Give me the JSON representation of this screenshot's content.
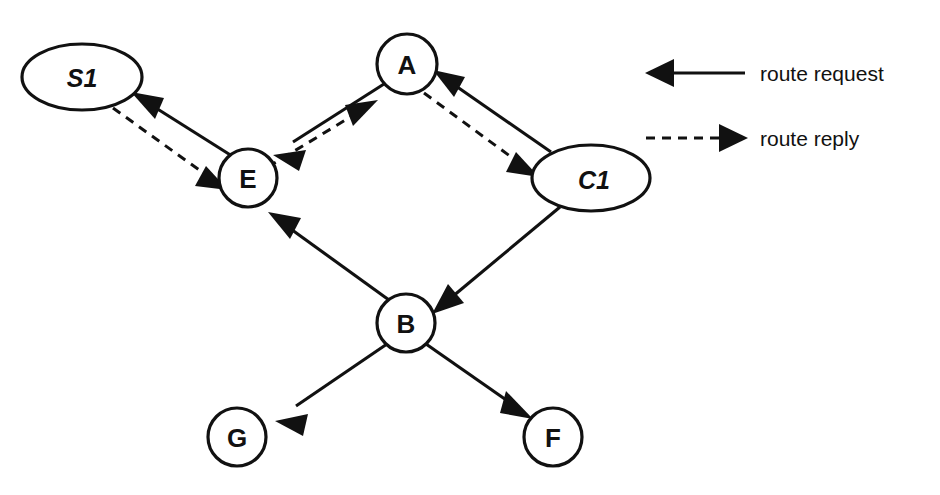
{
  "diagram": {
    "type": "network-routing-diagram",
    "background": "#ffffff",
    "ink_color": "#111111",
    "nodes": [
      {
        "id": "S1",
        "label": "S1",
        "shape": "ellipse",
        "style": "italic-bold",
        "cx": 82,
        "cy": 77,
        "rx": 60,
        "ry": 33
      },
      {
        "id": "A",
        "label": "A",
        "shape": "circle",
        "style": "bold",
        "cx": 407,
        "cy": 64,
        "rx": 30,
        "ry": 30
      },
      {
        "id": "E",
        "label": "E",
        "shape": "circle",
        "style": "bold",
        "cx": 248,
        "cy": 178,
        "rx": 29,
        "ry": 29
      },
      {
        "id": "C1",
        "label": "C1",
        "shape": "ellipse",
        "style": "italic-bold",
        "cx": 591,
        "cy": 178,
        "rx": 59,
        "ry": 33
      },
      {
        "id": "B",
        "label": "B",
        "shape": "circle",
        "style": "bold",
        "cx": 406,
        "cy": 323,
        "rx": 29,
        "ry": 29
      },
      {
        "id": "G",
        "label": "G",
        "shape": "circle",
        "style": "bold",
        "cx": 237,
        "cy": 437,
        "rx": 29,
        "ry": 29
      },
      {
        "id": "F",
        "label": "F",
        "shape": "circle",
        "style": "bold",
        "cx": 553,
        "cy": 437,
        "rx": 29,
        "ry": 29
      }
    ],
    "edges": [
      {
        "id": "e-s1-request",
        "from": "E",
        "to": "S1",
        "kind": "route request",
        "style": "solid",
        "name": "edge-e-to-s1-route-request"
      },
      {
        "id": "e-s1-reply",
        "from": "S1",
        "to": "E",
        "kind": "route reply",
        "style": "dashed",
        "name": "edge-s1-to-e-route-reply"
      },
      {
        "id": "e-a-e-req",
        "from": "A",
        "to": "E",
        "kind": "route request",
        "style": "solid",
        "name": "edge-a-to-e-route-request"
      },
      {
        "id": "e-e-a-rep",
        "from": "E",
        "to": "A",
        "kind": "route reply",
        "style": "dashed",
        "name": "edge-e-to-a-route-reply"
      },
      {
        "id": "e-c1-a-req",
        "from": "C1",
        "to": "A",
        "kind": "route request",
        "style": "solid",
        "name": "edge-c1-to-a-route-request"
      },
      {
        "id": "e-a-c1-rep",
        "from": "A",
        "to": "C1",
        "kind": "route reply",
        "style": "dashed",
        "name": "edge-a-to-c1-route-reply"
      },
      {
        "id": "e-b-e-req",
        "from": "B",
        "to": "E",
        "kind": "route request",
        "style": "solid",
        "name": "edge-b-to-e-route-request"
      },
      {
        "id": "e-c1-b-req",
        "from": "C1",
        "to": "B",
        "kind": "route request",
        "style": "solid",
        "name": "edge-c1-to-b-route-request"
      },
      {
        "id": "e-b-g-req",
        "from": "B",
        "to": "G",
        "kind": "route request",
        "style": "solid",
        "name": "edge-b-to-g-route-request"
      },
      {
        "id": "e-b-f-req",
        "from": "B",
        "to": "F",
        "kind": "route request",
        "style": "solid",
        "name": "edge-b-to-f-route-request"
      }
    ]
  },
  "legend": {
    "items": [
      {
        "id": "route-request",
        "label": "route request",
        "style": "solid",
        "arrow_direction": "left"
      },
      {
        "id": "route-reply",
        "label": "route reply",
        "style": "dashed",
        "arrow_direction": "right"
      }
    ]
  }
}
